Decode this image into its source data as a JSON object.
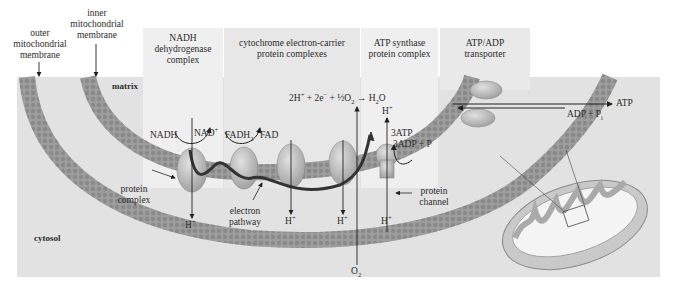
{
  "figure": {
    "type": "mitochondrial electron transport chain diagram",
    "colors": {
      "background": "#e2e2e2",
      "panel_light": "#efefef",
      "panel_mid": "#e6e6e6",
      "membrane": "#9a9a9a",
      "membrane_dark": "#7d7d7d",
      "protein": "#bdbdbd",
      "pathway": "#333333"
    }
  },
  "labels": {
    "outer_membrane": [
      "outer",
      "mitochondrial",
      "membrane"
    ],
    "inner_membrane": [
      "inner",
      "mitochondrial",
      "membrane"
    ],
    "matrix": "matrix",
    "cytosol": "cytosol"
  },
  "panels": [
    {
      "id": "nadh",
      "title": [
        "NADH",
        "dehydrogenase",
        "complex"
      ]
    },
    {
      "id": "cytochrome",
      "title": [
        "cytochrome electron-carrier",
        "protein complexes"
      ]
    },
    {
      "id": "atp-synthase",
      "title": [
        "ATP synthase",
        "protein complex"
      ]
    },
    {
      "id": "transporter",
      "title": [
        "ATP/ADP",
        "transporter"
      ]
    }
  ],
  "reactions": {
    "water": {
      "lhs": "2H",
      "lhs_sup": "+",
      "plus1": " + 2e",
      "e_sup": "−",
      "plus2": " + ",
      "half": "½",
      "o2": "O",
      "o2_sub": "2",
      "arrow": " → ",
      "h2o": "H",
      "h2o_sub": "2",
      "h2o_o": "O"
    },
    "nadh": {
      "left": "NADH",
      "right": "NAD",
      "right_sup": "+"
    },
    "fadh": {
      "left": "FADH",
      "left_sub": "2",
      "right": "FAD"
    },
    "atp": {
      "top": "3ATP",
      "bottom": "3ADP + P"
    },
    "transport": {
      "out": "ATP",
      "in": "ADP + P",
      "in_sub": "i"
    },
    "h_plus": "H",
    "h_plus_sup": "+",
    "o2": "O",
    "o2_sub": "2"
  },
  "callouts": {
    "protein_complex": [
      "protein",
      "complex"
    ],
    "electron_pathway": [
      "electron",
      "pathway"
    ],
    "protein_channel": [
      "protein",
      "channel"
    ]
  }
}
